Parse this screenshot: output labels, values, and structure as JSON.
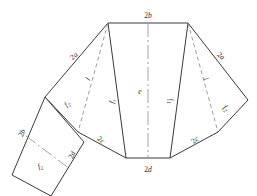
{
  "diagram": {
    "type": "engineering-line-drawing",
    "stroke_color": "#3a3a3a",
    "background_color": "#ffffff",
    "labels": [
      {
        "id": "top-edge",
        "text": "2b",
        "symbol": "2b",
        "x": 148,
        "y": 16,
        "rotate": 0,
        "kind": "dimension"
      },
      {
        "id": "bottom-edge",
        "text": "2d",
        "symbol": "2d",
        "x": 148,
        "y": 170,
        "rotate": 0,
        "kind": "dimension"
      },
      {
        "id": "left-outer-edge",
        "text": "2a",
        "symbol": "2a",
        "x": 74,
        "y": 56,
        "rotate": -40,
        "kind": "dimension"
      },
      {
        "id": "right-outer-edge",
        "text": "2a",
        "symbol": "2a",
        "x": 221,
        "y": 56,
        "rotate": 40,
        "kind": "dimension"
      },
      {
        "id": "left-lower-edge",
        "text": "2c",
        "symbol": "2c",
        "x": 101,
        "y": 140,
        "rotate": 38,
        "kind": "dimension"
      },
      {
        "id": "right-lower-edge",
        "text": "2c",
        "symbol": "2c",
        "x": 195,
        "y": 140,
        "rotate": -38,
        "kind": "dimension"
      },
      {
        "id": "rect-left-edge",
        "text": "2b",
        "symbol": "2b",
        "x": 22,
        "y": 133,
        "rotate": -65,
        "kind": "dimension"
      },
      {
        "id": "rect-right-edge",
        "text": "2d",
        "symbol": "2d",
        "x": 72,
        "y": 155,
        "rotate": -65,
        "kind": "dimension"
      },
      {
        "id": "left-fold-l",
        "text": "l",
        "symbol": "l",
        "x": 88,
        "y": 79,
        "rotate": -63,
        "kind": "fold-length"
      },
      {
        "id": "right-fold-l",
        "text": "l",
        "symbol": "l",
        "x": 206,
        "y": 79,
        "rotate": 63,
        "kind": "fold-length"
      },
      {
        "id": "center-e",
        "text": "e",
        "symbol": "e",
        "x": 140,
        "y": 92,
        "rotate": 0,
        "kind": "centerline-dim"
      },
      {
        "id": "left-panel-f1",
        "text": "f1",
        "symbol": "f₁",
        "x": 112,
        "y": 101,
        "rotate": -78,
        "kind": "panel"
      },
      {
        "id": "right-panel-f1",
        "text": "f1",
        "symbol": "f₁",
        "x": 171,
        "y": 101,
        "rotate": 78,
        "kind": "panel"
      },
      {
        "id": "left-panel-f2",
        "text": "f2",
        "symbol": "f₂",
        "x": 67,
        "y": 104,
        "rotate": -42,
        "kind": "panel"
      },
      {
        "id": "right-panel-f2",
        "text": "f2",
        "symbol": "f₂",
        "x": 226,
        "y": 108,
        "rotate": 42,
        "kind": "panel"
      },
      {
        "id": "rect-panel-f2",
        "text": "f2",
        "symbol": "f₂",
        "x": 40,
        "y": 166,
        "rotate": -22,
        "kind": "panel"
      }
    ],
    "symbol_legend": [
      {
        "symbol": "2a",
        "meaning": "outer slant edge length"
      },
      {
        "symbol": "2b",
        "meaning": "top edge / rectangle short edge"
      },
      {
        "symbol": "2c",
        "meaning": "lower slant edge length"
      },
      {
        "symbol": "2d",
        "meaning": "bottom edge / rectangle long edge"
      },
      {
        "symbol": "e",
        "meaning": "central panel height"
      },
      {
        "symbol": "f1",
        "meaning": "inner side panel"
      },
      {
        "symbol": "f2",
        "meaning": "outer side panel"
      },
      {
        "symbol": "l",
        "meaning": "fold line length"
      }
    ],
    "geometry": {
      "solid_outline": [
        [
          108,
          23
        ],
        [
          188,
          23
        ],
        [
          248,
          100
        ],
        [
          218,
          132
        ],
        [
          170,
          158
        ],
        [
          126,
          158
        ],
        [
          78,
          132
        ],
        [
          45,
          97
        ],
        [
          108,
          23
        ]
      ],
      "solid_lines": [
        {
          "id": "inner-left-panel-edge",
          "from": [
            108,
            23
          ],
          "to": [
            126,
            158
          ]
        },
        {
          "id": "inner-right-panel-edge",
          "from": [
            188,
            23
          ],
          "to": [
            170,
            158
          ]
        },
        {
          "id": "rect-top-edge",
          "from": [
            45,
            97
          ],
          "to": [
            84,
            142
          ]
        },
        {
          "id": "rect-bottom-edge",
          "from": [
            12,
            175
          ],
          "to": [
            51,
            196
          ]
        },
        {
          "id": "rect-left-edge",
          "from": [
            45,
            97
          ],
          "to": [
            12,
            175
          ]
        },
        {
          "id": "rect-right-edge",
          "from": [
            84,
            142
          ],
          "to": [
            51,
            196
          ]
        }
      ],
      "dashed_fold_lines": [
        {
          "id": "left-fold",
          "from": [
            108,
            23
          ],
          "to": [
            78,
            132
          ]
        },
        {
          "id": "right-fold",
          "from": [
            188,
            23
          ],
          "to": [
            218,
            132
          ]
        }
      ],
      "centerlines": [
        {
          "id": "main-vertical-centerline",
          "from": [
            148,
            23
          ],
          "to": [
            148,
            158
          ]
        },
        {
          "id": "rect-centerline",
          "from": [
            28,
            137
          ],
          "to": [
            68,
            168
          ]
        }
      ]
    }
  }
}
